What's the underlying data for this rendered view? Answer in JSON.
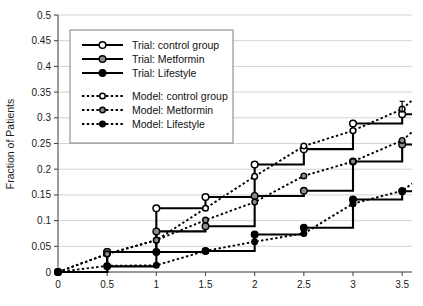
{
  "chart_data": {
    "type": "line",
    "title": "",
    "subtitle": "",
    "xlabel": "",
    "ylabel": "Fraction of Patients",
    "xlim": [
      0,
      3.6
    ],
    "ylim": [
      0,
      0.5
    ],
    "grid": true,
    "legend_position": "upper-left",
    "xticks": [
      0,
      0.5,
      1,
      1.5,
      2,
      2.5,
      3,
      3.5
    ],
    "xticklabels": [
      "0",
      "0.5",
      "1",
      "1.5",
      "2",
      "2.5",
      "3",
      "3.5"
    ],
    "yticks": [
      0,
      0.05,
      0.1,
      0.15,
      0.2,
      0.25,
      0.3,
      0.35,
      0.4,
      0.45,
      0.5
    ],
    "yticklabels": [
      "0",
      "0.05",
      "0.1",
      "0.15",
      "0.2",
      "0.25",
      "0.3",
      "0.35",
      "0.4",
      "0.45",
      "0.5"
    ],
    "series": [
      {
        "name": "Trial: control group",
        "style": "step-solid",
        "marker": "open-circle",
        "x": [
          0,
          0.5,
          1,
          1.5,
          2,
          2.5,
          3,
          3.5,
          3.6
        ],
        "values": [
          0,
          0.039,
          0.124,
          0.146,
          0.209,
          0.239,
          0.289,
          0.307,
          0.307
        ]
      },
      {
        "name": "Trial: Metformin",
        "style": "step-solid",
        "marker": "grey-circle",
        "x": [
          0,
          0.5,
          1,
          1.5,
          2,
          2.5,
          3,
          3.5,
          3.6
        ],
        "values": [
          0,
          0.039,
          0.079,
          0.089,
          0.148,
          0.158,
          0.215,
          0.248,
          0.248
        ]
      },
      {
        "name": "Trial: Lifestyle",
        "style": "step-solid",
        "marker": "solid-circle",
        "x": [
          0,
          0.5,
          1,
          1.5,
          2,
          2.5,
          3,
          3.5,
          3.6
        ],
        "values": [
          0,
          0.011,
          0.039,
          0.041,
          0.073,
          0.086,
          0.141,
          0.157,
          0.157
        ]
      },
      {
        "name": "Model: control group",
        "style": "dashed",
        "marker": "open-circle",
        "x": [
          0,
          0.5,
          1,
          1.5,
          2,
          2.5,
          3,
          3.5,
          3.6
        ],
        "values": [
          0,
          0.035,
          0.062,
          0.124,
          0.186,
          0.245,
          0.275,
          0.317,
          0.334
        ]
      },
      {
        "name": "Model: Metformin",
        "style": "dashed",
        "marker": "grey-circle",
        "x": [
          0,
          0.5,
          1,
          1.5,
          2,
          2.5,
          3,
          3.5,
          3.6
        ],
        "values": [
          0,
          0.035,
          0.062,
          0.101,
          0.136,
          0.187,
          0.215,
          0.256,
          0.272
        ]
      },
      {
        "name": "Model: Lifestyle",
        "style": "dashed",
        "marker": "solid-circle",
        "x": [
          0,
          0.5,
          1,
          1.5,
          2,
          2.5,
          3,
          3.5,
          3.6
        ],
        "values": [
          0,
          0.012,
          0.013,
          0.041,
          0.059,
          0.075,
          0.133,
          0.158,
          0.172
        ]
      }
    ],
    "error_bars": [
      {
        "series": "Trial: control group",
        "x": 3.5,
        "y": 0.317,
        "upper": 0.332,
        "lower": 0.312
      }
    ]
  },
  "axes": {
    "y_title": "Fraction of Patients"
  },
  "legend": {
    "entries": [
      {
        "label": "Trial: control group",
        "style": "solid",
        "marker": "open-circle"
      },
      {
        "label": "Trial: Metformin",
        "style": "solid",
        "marker": "grey-circle"
      },
      {
        "label": "Trial: Lifestyle",
        "style": "solid",
        "marker": "solid-circle"
      },
      {
        "label": "Model: control group",
        "style": "dashed",
        "marker": "open-circle"
      },
      {
        "label": "Model: Metformin",
        "style": "dashed",
        "marker": "grey-circle"
      },
      {
        "label": "Model: Lifestyle",
        "style": "dashed",
        "marker": "solid-circle"
      }
    ]
  }
}
